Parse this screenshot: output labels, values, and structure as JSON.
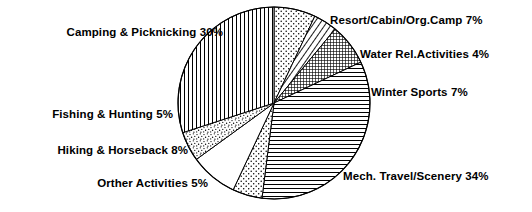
{
  "chart_data": {
    "type": "pie",
    "title": "",
    "subtitle": "",
    "xlabel": "",
    "ylabel": "",
    "legend_position": "none",
    "grid": false,
    "units": "percent",
    "total": 100,
    "start_angle_deg": 0,
    "direction": "clockwise",
    "categories": [
      "Resort/Cabin/Org.Camp",
      "Water Rel.Activities",
      "Winter Sports",
      "Mech. Travel/Scenery",
      "Orther Activities",
      "Hiking & Horseback",
      "Fishing & Hunting",
      "Camping & Picknicking"
    ],
    "values": [
      7,
      4,
      7,
      34,
      5,
      8,
      5,
      30
    ],
    "slices": [
      {
        "name": "Resort/Cabin/Org.Camp",
        "value": 7,
        "value_text": "7%",
        "label": "Resort/Cabin/Org.Camp 7%",
        "pattern": "dots",
        "fill": "#ffffff",
        "stroke": "#000000"
      },
      {
        "name": "Water Rel.Activities",
        "value": 4,
        "value_text": "4%",
        "label": "Water Rel.Activities 4%",
        "pattern": "diagonal-hatch",
        "fill": "#ffffff",
        "stroke": "#000000"
      },
      {
        "name": "Winter Sports",
        "value": 7,
        "value_text": "7%",
        "label": "Winter Sports 7%",
        "pattern": "fine-grid",
        "fill": "#ffffff",
        "stroke": "#000000"
      },
      {
        "name": "Mech. Travel/Scenery",
        "value": 34,
        "value_text": "34%",
        "label": "Mech. Travel/Scenery 34%",
        "pattern": "horizontal-lines",
        "fill": "#ffffff",
        "stroke": "#000000"
      },
      {
        "name": "Orther Activities",
        "value": 5,
        "value_text": "5%",
        "label": "Orther Activities 5%",
        "pattern": "dots",
        "fill": "#ffffff",
        "stroke": "#000000"
      },
      {
        "name": "Hiking & Horseback",
        "value": 8,
        "value_text": "8%",
        "label": "Hiking & Horseback 8%",
        "pattern": "blank",
        "fill": "#ffffff",
        "stroke": "#000000"
      },
      {
        "name": "Fishing & Hunting",
        "value": 5,
        "value_text": "5%",
        "label": "Fishing & Hunting 5%",
        "pattern": "stipple",
        "fill": "#ffffff",
        "stroke": "#000000"
      },
      {
        "name": "Camping & Picknicking",
        "value": 30,
        "value_text": "30%",
        "label": "Camping & Picknicking 30%",
        "pattern": "vertical-lines",
        "fill": "#ffffff",
        "stroke": "#000000"
      }
    ]
  },
  "labels": {
    "camping": "Camping & Picknicking 30%",
    "resort": "Resort/Cabin/Org.Camp 7%",
    "water": "Water Rel.Activities 4%",
    "winter": "Winter Sports 7%",
    "mech": "Mech. Travel/Scenery 34%",
    "orther": "Orther Activities 5%",
    "hiking": "Hiking & Horseback 8%",
    "fishing": "Fishing & Hunting 5%"
  },
  "colors": {
    "background": "#ffffff",
    "ink": "#000000"
  }
}
